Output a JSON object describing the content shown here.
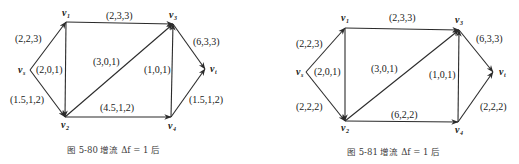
{
  "figures": [
    {
      "id": "left",
      "caption": "图 5-80    增流 Δf = 1 后",
      "caption_pos": [
        67,
        153
      ],
      "nodes": {
        "vs": {
          "sub": "s",
          "x": 30,
          "y": 70,
          "lx": 18,
          "ly": 73
        },
        "v1": {
          "sub": "1",
          "x": 66,
          "y": 22,
          "lx": 62,
          "ly": 16
        },
        "v2": {
          "sub": "2",
          "x": 65,
          "y": 117,
          "lx": 61,
          "ly": 128
        },
        "v3": {
          "sub": "3",
          "x": 173,
          "y": 24,
          "lx": 169,
          "ly": 18
        },
        "v4": {
          "sub": "4",
          "x": 171,
          "y": 117,
          "lx": 168,
          "ly": 129
        },
        "vt": {
          "sub": "t",
          "x": 205,
          "y": 69,
          "lx": 210,
          "ly": 72
        }
      },
      "edges": [
        {
          "from": "vs",
          "to": "v1",
          "label": "(2,2,3)",
          "lx": 15,
          "ly": 42
        },
        {
          "from": "vs",
          "to": "v2",
          "label": "(1.5,1,2)",
          "lx": 10,
          "ly": 103
        },
        {
          "from": "v1",
          "to": "v2",
          "label": "(2,0,1)",
          "lx": 36,
          "ly": 73
        },
        {
          "from": "v1",
          "to": "v3",
          "label": "(2,3,3)",
          "lx": 106,
          "ly": 19
        },
        {
          "from": "v2",
          "to": "v3",
          "label": "(3,0,1)",
          "lx": 93,
          "ly": 65
        },
        {
          "from": "v2",
          "to": "v4",
          "label": "(4.5,1,2)",
          "lx": 100,
          "ly": 111
        },
        {
          "from": "v4",
          "to": "v3",
          "label": "(1,0,1)",
          "lx": 144,
          "ly": 73
        },
        {
          "from": "v3",
          "to": "vt",
          "label": "(6,3,3)",
          "lx": 193,
          "ly": 45
        },
        {
          "from": "v4",
          "to": "vt",
          "label": "(1.5,1,2)",
          "lx": 189,
          "ly": 103
        }
      ]
    },
    {
      "id": "right",
      "caption": "图 5-81    增流 Δf = 1 后",
      "caption_pos": [
        347,
        155
      ],
      "nodes": {
        "vs": {
          "sub": "s",
          "x": 306,
          "y": 72,
          "lx": 296,
          "ly": 75
        },
        "v1": {
          "sub": "1",
          "x": 345,
          "y": 28,
          "lx": 341,
          "ly": 21
        },
        "v2": {
          "sub": "2",
          "x": 345,
          "y": 121,
          "lx": 341,
          "ly": 131
        },
        "v3": {
          "sub": "3",
          "x": 459,
          "y": 30,
          "lx": 455,
          "ly": 23
        },
        "v4": {
          "sub": "4",
          "x": 458,
          "y": 122,
          "lx": 455,
          "ly": 133
        },
        "vt": {
          "sub": "t",
          "x": 493,
          "y": 72,
          "lx": 499,
          "ly": 75
        }
      },
      "edges": [
        {
          "from": "vs",
          "to": "v1",
          "label": "(2,2,3)",
          "lx": 296,
          "ly": 47
        },
        {
          "from": "vs",
          "to": "v2",
          "label": "(2,2,2)",
          "lx": 296,
          "ly": 110
        },
        {
          "from": "v1",
          "to": "v2",
          "label": "(2,0,1)",
          "lx": 314,
          "ly": 75
        },
        {
          "from": "v1",
          "to": "v3",
          "label": "(2,3,3)",
          "lx": 389,
          "ly": 21
        },
        {
          "from": "v2",
          "to": "v3",
          "label": "(3,0,1)",
          "lx": 371,
          "ly": 72
        },
        {
          "from": "v2",
          "to": "v4",
          "label": "(6,2,2)",
          "lx": 391,
          "ly": 118
        },
        {
          "from": "v4",
          "to": "v3",
          "label": "(1,0,1)",
          "lx": 429,
          "ly": 78
        },
        {
          "from": "v3",
          "to": "vt",
          "label": "(6,3,3)",
          "lx": 476,
          "ly": 42
        },
        {
          "from": "v4",
          "to": "vt",
          "label": "(2,2,2)",
          "lx": 480,
          "ly": 110
        }
      ]
    }
  ]
}
